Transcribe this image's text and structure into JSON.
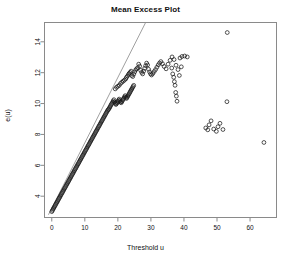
{
  "chart_data": {
    "type": "scatter",
    "title": "Mean Excess Plot",
    "xlabel": "Threshold u",
    "ylabel": "e(u)",
    "xlim": [
      -2.2,
      68.0
    ],
    "ylim": [
      2.62,
      15.25
    ],
    "xticks": [
      0,
      10,
      20,
      30,
      40,
      50,
      60
    ],
    "xtick_labels": [
      "0",
      "10",
      "20",
      "30",
      "40",
      "50",
      "60"
    ],
    "yticks": [
      4,
      6,
      8,
      10,
      12,
      14
    ],
    "ytick_labels": [
      "4",
      "6",
      "8",
      "10",
      "12",
      "14"
    ],
    "grid": false,
    "legend": null,
    "marker": "open-circle",
    "marker_color": "#1a1a1a",
    "box_color": "#8a8a8a",
    "reference_line": {
      "name": "diagonal-reference-line",
      "color": "#777777",
      "x": [
        -1.0,
        28.4
      ],
      "y": [
        2.8,
        15.25
      ]
    },
    "series": [
      {
        "name": "mean excess",
        "points": [
          [
            0.0,
            3.0
          ],
          [
            0.2,
            3.08
          ],
          [
            0.4,
            3.16
          ],
          [
            0.6,
            3.24
          ],
          [
            0.8,
            3.31
          ],
          [
            1.0,
            3.39
          ],
          [
            1.2,
            3.47
          ],
          [
            1.4,
            3.55
          ],
          [
            1.6,
            3.62
          ],
          [
            1.8,
            3.7
          ],
          [
            2.0,
            3.78
          ],
          [
            2.2,
            3.86
          ],
          [
            2.4,
            3.93
          ],
          [
            2.6,
            4.01
          ],
          [
            2.8,
            4.09
          ],
          [
            3.0,
            4.17
          ],
          [
            3.2,
            4.24
          ],
          [
            3.4,
            4.32
          ],
          [
            3.6,
            4.4
          ],
          [
            3.8,
            4.48
          ],
          [
            4.0,
            4.55
          ],
          [
            4.2,
            4.63
          ],
          [
            4.4,
            4.71
          ],
          [
            4.6,
            4.79
          ],
          [
            4.8,
            4.86
          ],
          [
            5.0,
            4.94
          ],
          [
            5.2,
            5.02
          ],
          [
            5.4,
            5.1
          ],
          [
            5.6,
            5.17
          ],
          [
            5.8,
            5.25
          ],
          [
            6.0,
            5.33
          ],
          [
            6.2,
            5.41
          ],
          [
            6.4,
            5.48
          ],
          [
            6.6,
            5.56
          ],
          [
            6.8,
            5.64
          ],
          [
            7.0,
            5.72
          ],
          [
            7.2,
            5.79
          ],
          [
            7.4,
            5.87
          ],
          [
            7.6,
            5.95
          ],
          [
            7.8,
            6.03
          ],
          [
            8.0,
            6.1
          ],
          [
            8.2,
            6.18
          ],
          [
            8.4,
            6.26
          ],
          [
            8.6,
            6.34
          ],
          [
            8.8,
            6.41
          ],
          [
            9.0,
            6.49
          ],
          [
            9.2,
            6.57
          ],
          [
            9.4,
            6.65
          ],
          [
            9.6,
            6.72
          ],
          [
            9.8,
            6.8
          ],
          [
            10.0,
            6.88
          ],
          [
            10.2,
            6.96
          ],
          [
            10.4,
            7.03
          ],
          [
            10.6,
            7.11
          ],
          [
            10.8,
            7.19
          ],
          [
            11.0,
            7.27
          ],
          [
            11.2,
            7.34
          ],
          [
            11.4,
            7.42
          ],
          [
            11.6,
            7.5
          ],
          [
            11.8,
            7.58
          ],
          [
            12.0,
            7.65
          ],
          [
            12.2,
            7.73
          ],
          [
            12.4,
            7.81
          ],
          [
            12.6,
            7.89
          ],
          [
            12.8,
            7.96
          ],
          [
            13.0,
            8.04
          ],
          [
            13.2,
            8.12
          ],
          [
            13.4,
            8.2
          ],
          [
            13.6,
            8.27
          ],
          [
            13.8,
            8.35
          ],
          [
            14.0,
            8.43
          ],
          [
            14.2,
            8.51
          ],
          [
            14.4,
            8.58
          ],
          [
            14.6,
            8.66
          ],
          [
            14.8,
            8.74
          ],
          [
            15.0,
            8.82
          ],
          [
            15.2,
            8.89
          ],
          [
            15.4,
            8.97
          ],
          [
            15.6,
            9.05
          ],
          [
            15.8,
            9.13
          ],
          [
            16.0,
            9.2
          ],
          [
            16.2,
            9.28
          ],
          [
            16.4,
            9.36
          ],
          [
            16.6,
            9.44
          ],
          [
            16.8,
            9.51
          ],
          [
            17.0,
            9.59
          ],
          [
            17.2,
            9.63
          ],
          [
            17.4,
            9.7
          ],
          [
            17.6,
            9.78
          ],
          [
            17.8,
            9.86
          ],
          [
            18.0,
            9.94
          ],
          [
            18.2,
            10.01
          ],
          [
            18.4,
            10.09
          ],
          [
            18.6,
            10.17
          ],
          [
            18.8,
            10.25
          ],
          [
            19.0,
            10.1
          ],
          [
            19.2,
            10.02
          ],
          [
            19.4,
            9.94
          ],
          [
            19.6,
            9.99
          ],
          [
            19.8,
            10.06
          ],
          [
            20.0,
            10.14
          ],
          [
            20.2,
            10.22
          ],
          [
            20.4,
            10.29
          ],
          [
            20.6,
            10.18
          ],
          [
            20.8,
            10.11
          ],
          [
            21.0,
            10.05
          ],
          [
            21.2,
            10.12
          ],
          [
            21.4,
            10.2
          ],
          [
            21.6,
            10.28
          ],
          [
            21.8,
            10.35
          ],
          [
            22.0,
            10.43
          ],
          [
            22.2,
            10.51
          ],
          [
            22.4,
            10.41
          ],
          [
            22.6,
            10.33
          ],
          [
            22.8,
            10.4
          ],
          [
            23.0,
            10.48
          ],
          [
            23.2,
            10.56
          ],
          [
            23.4,
            10.63
          ],
          [
            23.6,
            10.71
          ],
          [
            23.8,
            10.79
          ],
          [
            24.0,
            10.87
          ],
          [
            24.2,
            10.94
          ],
          [
            24.4,
            11.02
          ],
          [
            24.6,
            11.1
          ],
          [
            24.8,
            11.18
          ]
        ]
      },
      {
        "name": "upper scatter",
        "points": [
          [
            19.2,
            10.95
          ],
          [
            19.6,
            11.05
          ],
          [
            20.0,
            11.12
          ],
          [
            20.4,
            11.18
          ],
          [
            20.8,
            11.3
          ],
          [
            21.2,
            11.38
          ],
          [
            21.6,
            11.45
          ],
          [
            22.0,
            11.52
          ],
          [
            22.4,
            11.6
          ],
          [
            22.6,
            11.7
          ],
          [
            22.9,
            11.78
          ],
          [
            23.2,
            11.88
          ],
          [
            23.4,
            11.95
          ],
          [
            23.7,
            12.02
          ],
          [
            24.0,
            12.1
          ],
          [
            24.2,
            11.82
          ],
          [
            24.5,
            11.75
          ],
          [
            24.8,
            11.9
          ],
          [
            25.1,
            12.05
          ],
          [
            25.4,
            12.18
          ],
          [
            25.7,
            12.25
          ],
          [
            26.0,
            12.32
          ],
          [
            26.3,
            12.55
          ],
          [
            26.6,
            12.42
          ],
          [
            26.9,
            12.15
          ],
          [
            27.2,
            12.02
          ],
          [
            27.5,
            11.92
          ],
          [
            27.8,
            12.1
          ],
          [
            28.1,
            12.28
          ],
          [
            28.4,
            12.45
          ],
          [
            28.7,
            12.62
          ],
          [
            29.0,
            12.5
          ],
          [
            29.3,
            12.22
          ],
          [
            29.6,
            12.05
          ],
          [
            29.9,
            11.92
          ],
          [
            30.2,
            11.85
          ],
          [
            30.6,
            11.95
          ],
          [
            31.0,
            12.08
          ],
          [
            31.4,
            12.2
          ],
          [
            31.8,
            12.35
          ],
          [
            32.2,
            12.5
          ],
          [
            32.6,
            12.62
          ],
          [
            33.0,
            12.72
          ],
          [
            33.5,
            12.58
          ],
          [
            34.0,
            12.4
          ],
          [
            34.6,
            12.25
          ],
          [
            35.2,
            12.55
          ],
          [
            35.8,
            12.8
          ],
          [
            36.4,
            13.02
          ],
          [
            37.0,
            12.85
          ],
          [
            37.6,
            12.48
          ],
          [
            38.2,
            12.2
          ],
          [
            38.8,
            12.95
          ],
          [
            39.4,
            13.05
          ],
          [
            40.2,
            13.08
          ],
          [
            41.0,
            13.02
          ]
        ]
      },
      {
        "name": "descending sparse column",
        "points": [
          [
            36.3,
            12.3
          ],
          [
            36.6,
            11.92
          ],
          [
            36.9,
            11.7
          ],
          [
            37.1,
            11.42
          ],
          [
            37.3,
            11.18
          ],
          [
            37.5,
            10.72
          ],
          [
            37.7,
            10.48
          ],
          [
            37.9,
            10.15
          ],
          [
            38.6,
            11.82
          ],
          [
            39.2,
            12.38
          ]
        ]
      },
      {
        "name": "low right cluster",
        "points": [
          [
            46.6,
            8.42
          ],
          [
            47.2,
            8.3
          ],
          [
            47.6,
            8.62
          ],
          [
            48.2,
            8.88
          ],
          [
            49.0,
            8.35
          ],
          [
            49.8,
            8.2
          ],
          [
            50.3,
            8.5
          ],
          [
            50.9,
            8.72
          ],
          [
            51.8,
            8.32
          ]
        ]
      },
      {
        "name": "isolated points",
        "points": [
          [
            53.1,
            14.6
          ],
          [
            53.0,
            10.12
          ],
          [
            64.2,
            7.48
          ]
        ]
      }
    ]
  }
}
